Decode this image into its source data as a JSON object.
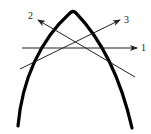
{
  "diagram": {
    "colors": {
      "background": "#ffffff",
      "arch": "#000000",
      "lines": "#222222"
    },
    "arch": {
      "apex": [
        73,
        12
      ],
      "left_base": [
        18,
        126
      ],
      "right_base": [
        132,
        128
      ]
    },
    "lines": [
      {
        "id": "1",
        "label": "1",
        "from": [
          22,
          48
        ],
        "to": [
          137,
          48
        ],
        "label_pos": [
          141,
          51
        ]
      },
      {
        "id": "2",
        "label": "2",
        "from": [
          135,
          77
        ],
        "to": [
          38,
          20
        ],
        "label_pos": [
          28,
          19
        ]
      },
      {
        "id": "3",
        "label": "3",
        "from": [
          20,
          69
        ],
        "to": [
          120,
          20
        ],
        "label_pos": [
          124,
          23
        ]
      }
    ]
  }
}
